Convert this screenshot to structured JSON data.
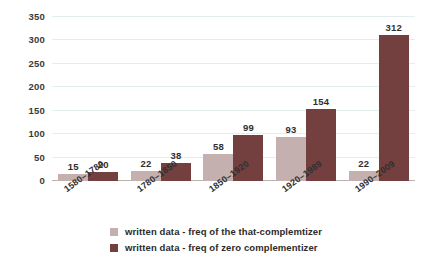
{
  "chart_data": {
    "type": "bar",
    "title": "",
    "xlabel": "",
    "ylabel": "",
    "ylim": [
      0,
      350
    ],
    "yticks": [
      0,
      50,
      100,
      150,
      200,
      250,
      300,
      350
    ],
    "grid": true,
    "legend_position": "bottom",
    "categories": [
      "1580–1780",
      "1780–1850",
      "1850–1920",
      "1920–1989",
      "1990–2009"
    ],
    "series": [
      {
        "name": "written data - freq of the that-complemtizer",
        "color": "#c4b1af",
        "values": [
          15,
          22,
          58,
          93,
          22
        ]
      },
      {
        "name": "written data - freq of zero complementizer",
        "color": "#74403f",
        "values": [
          20,
          38,
          99,
          154,
          312
        ]
      }
    ]
  },
  "colors": {
    "light_bar": "#c4b1af",
    "dark_bar": "#74403f",
    "gridline": "#e3efef",
    "axis": "#b9b2b0",
    "background": "#ffffff",
    "text": "#2b2b2b"
  }
}
